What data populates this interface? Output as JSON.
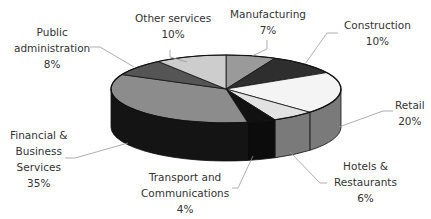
{
  "chart_data": {
    "type": "pie",
    "style": "3d",
    "title": "",
    "start_angle_deg": -90,
    "direction": "clockwise",
    "slices": [
      {
        "label": "Manufacturing",
        "value": 7,
        "pct_label": "7%",
        "top_color": "#9a9a9a",
        "side_color": "#6a6a6a"
      },
      {
        "label": "Construction",
        "value": 10,
        "pct_label": "10%",
        "top_color": "#2e2e2e",
        "side_color": "#1a1a1a"
      },
      {
        "label": "Retail",
        "value": 20,
        "pct_label": "20%",
        "top_color": "#f4f4f4",
        "side_color": "#7a7a7a"
      },
      {
        "label": "Hotels & Restaurants",
        "value": 6,
        "pct_label": "6%",
        "top_color": "#e2e2e2",
        "side_color": "#7a7a7a"
      },
      {
        "label": "Transport and Communications",
        "value": 4,
        "pct_label": "4%",
        "top_color": "#111111",
        "side_color": "#0c0c0c"
      },
      {
        "label": "Financial & Business Services",
        "value": 35,
        "pct_label": "35%",
        "top_color": "#8c8c8c",
        "side_color": "#141414"
      },
      {
        "label": "Public administration",
        "value": 8,
        "pct_label": "8%",
        "top_color": "#555555",
        "side_color": "#2a2a2a"
      },
      {
        "label": "Other services",
        "value": 10,
        "pct_label": "10%",
        "top_color": "#cdcdcd",
        "side_color": "#8a8a8a"
      }
    ],
    "legend": "none (callout labels with leader lines)"
  },
  "labels": {
    "manufacturing": {
      "line1": "Manufacturing",
      "pct": "7%"
    },
    "construction": {
      "line1": "Construction",
      "pct": "10%"
    },
    "retail": {
      "line1": "Retail",
      "pct": "20%"
    },
    "hotels": {
      "line1": "Hotels &",
      "line2": "Restaurants",
      "pct": "6%"
    },
    "transport": {
      "line1": "Transport and",
      "line2": "Communications",
      "pct": "4%"
    },
    "financial": {
      "line1": "Financial &",
      "line2": "Business",
      "line3": "Services",
      "pct": "35%"
    },
    "public": {
      "line1": "Public",
      "line2": "administration",
      "pct": "8%"
    },
    "other": {
      "line1": "Other services",
      "pct": "10%"
    }
  }
}
